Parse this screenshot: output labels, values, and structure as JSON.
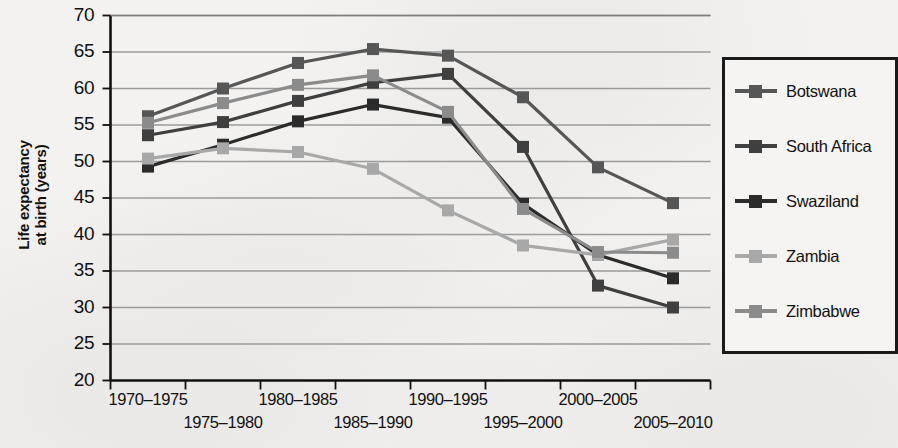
{
  "chart_data": {
    "type": "line",
    "title": "",
    "xlabel": "",
    "ylabel": "Life expectancy at birth (years)",
    "ylabel_line1": "Life expectancy",
    "ylabel_line2": "at birth (years)",
    "categories": [
      "1970–1975",
      "1975–1980",
      "1980–1985",
      "1985–1990",
      "1990–1995",
      "1995–2000",
      "2000–2005",
      "2005–2010"
    ],
    "xtick_labels_top": [
      "1970–1975",
      "1980–1985",
      "1990–1995",
      "2000–2005"
    ],
    "xtick_labels_bottom": [
      "1975–1980",
      "1985–1990",
      "1995–2000",
      "2005–2010"
    ],
    "ylim": [
      20,
      70
    ],
    "yticks": [
      70,
      65,
      60,
      55,
      50,
      45,
      40,
      35,
      30,
      25,
      20
    ],
    "grid": true,
    "legend_position": "right",
    "series": [
      {
        "name": "Botswana",
        "color": "#565656",
        "values": [
          56.2,
          60.0,
          63.5,
          65.4,
          64.5,
          58.8,
          49.2,
          44.3
        ]
      },
      {
        "name": "South Africa",
        "color": "#3f3f3f",
        "values": [
          53.6,
          55.4,
          58.3,
          60.8,
          62.0,
          52.0,
          33.0,
          30.0
        ]
      },
      {
        "name": "Swaziland",
        "color": "#2b2b2b",
        "values": [
          49.3,
          52.3,
          55.5,
          57.8,
          56.0,
          44.2,
          37.2,
          34.0
        ]
      },
      {
        "name": "Zambia",
        "color": "#a8a8a8",
        "values": [
          50.4,
          51.8,
          51.3,
          49.0,
          43.3,
          38.5,
          37.2,
          39.3
        ]
      },
      {
        "name": "Zimbabwe",
        "color": "#8b8b8b",
        "values": [
          55.3,
          58.0,
          60.5,
          61.8,
          56.8,
          43.5,
          37.6,
          37.5
        ]
      }
    ]
  }
}
